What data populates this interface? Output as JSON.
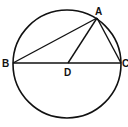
{
  "diagram": {
    "type": "geometry",
    "stroke_color": "#111111",
    "background": "#ffffff",
    "circle": {
      "cx": 67,
      "cy": 64,
      "r": 54
    },
    "points": {
      "A": {
        "label": "A",
        "x": 97,
        "y": 18
      },
      "B": {
        "label": "B",
        "x": 13,
        "y": 63
      },
      "C": {
        "label": "C",
        "x": 121,
        "y": 63
      },
      "D": {
        "label": "D",
        "x": 68,
        "y": 63
      }
    },
    "segments": [
      [
        "B",
        "C"
      ],
      [
        "A",
        "B"
      ],
      [
        "A",
        "C"
      ],
      [
        "A",
        "D"
      ]
    ]
  }
}
